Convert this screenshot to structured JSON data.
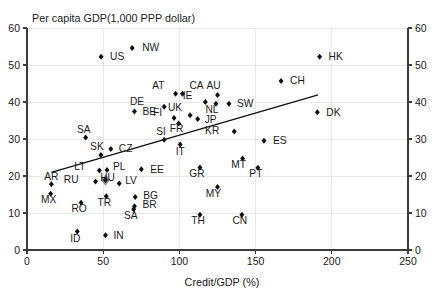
{
  "chart_data": {
    "type": "scatter",
    "title": "Per capita GDP(1,000 PPP dollar)",
    "xlabel": "Credit/GDP (%)",
    "ylabel": "Per capita GDP(1,000 PPP dollar)",
    "xlim": [
      0,
      250
    ],
    "ylim": [
      0,
      60
    ],
    "xticks": [
      0,
      50,
      100,
      150,
      200,
      250
    ],
    "yticks": [
      0,
      10,
      20,
      30,
      40,
      50,
      60
    ],
    "yticks_right": [
      0,
      10,
      20,
      30,
      40,
      50,
      60
    ],
    "grid": true,
    "legend": "none",
    "marker_shape": "diamond",
    "marker_color": "#101010",
    "highlight_color": "#8c8c8c",
    "points": [
      {
        "label": "NW",
        "x": 69.0,
        "y": 54.6,
        "lx": 10,
        "ly": 3.5
      },
      {
        "label": "US",
        "x": 48.6,
        "y": 52.2,
        "lx": 9,
        "ly": 3.5
      },
      {
        "label": "HK",
        "x": 192.0,
        "y": 52.2,
        "lx": 9,
        "ly": 3.5
      },
      {
        "label": "CH",
        "x": 166.7,
        "y": 45.7,
        "lx": 9,
        "ly": 3.5
      },
      {
        "label": "CA",
        "x": 102.0,
        "y": 42.2,
        "lx": 7,
        "ly": -4.5
      },
      {
        "label": "AT",
        "x": 97.5,
        "y": 42.2,
        "lx": -11,
        "ly": -4.5
      },
      {
        "label": "AU",
        "x": 125.0,
        "y": 41.9,
        "lx": -4,
        "ly": -5.5
      },
      {
        "label": "IE",
        "x": 117.0,
        "y": 40.0,
        "lx": -13,
        "ly": -3.5
      },
      {
        "label": "NL",
        "x": 124.0,
        "y": 39.5,
        "lx": -4,
        "ly": 9.5
      },
      {
        "label": "SW",
        "x": 132.5,
        "y": 39.5,
        "lx": 8,
        "ly": 3.5
      },
      {
        "label": "DE",
        "x": 90.0,
        "y": 38.7,
        "lx": -20,
        "ly": -2.0
      },
      {
        "label": "BE",
        "x": 70.5,
        "y": 37.4,
        "lx": 8,
        "ly": 3.5
      },
      {
        "label": "DK",
        "x": 190.5,
        "y": 37.2,
        "lx": 9,
        "ly": 3.5
      },
      {
        "label": "UK",
        "x": 107.0,
        "y": 36.4,
        "lx": -8,
        "ly": -4.5
      },
      {
        "label": "FI",
        "x": 96.5,
        "y": 35.7,
        "lx": -12,
        "ly": -1.5
      },
      {
        "label": "JP",
        "x": 112.0,
        "y": 35.4,
        "lx": 7,
        "ly": 4.0
      },
      {
        "label": "FR",
        "x": 99.5,
        "y": 34.2,
        "lx": -2,
        "ly": 8.5
      },
      {
        "label": "KR",
        "x": 136.0,
        "y": 32.0,
        "lx": -15,
        "ly": 2.0
      },
      {
        "label": "SA",
        "x": 38.5,
        "y": 30.4,
        "lx": -2,
        "ly": -4.5
      },
      {
        "label": "SI",
        "x": 90.0,
        "y": 29.8,
        "lx": -3,
        "ly": -4.5
      },
      {
        "label": "ES",
        "x": 155.5,
        "y": 29.5,
        "lx": 9,
        "ly": 3.5
      },
      {
        "label": "IT",
        "x": 100.5,
        "y": 28.5,
        "lx": 0,
        "ly": 10.0
      },
      {
        "label": "CZ",
        "x": 55.0,
        "y": 27.3,
        "lx": 8,
        "ly": 3.5
      },
      {
        "label": "SK",
        "x": 48.5,
        "y": 25.7,
        "lx": -4,
        "ly": -4.5
      },
      {
        "label": "MT",
        "x": 141.5,
        "y": 24.7,
        "lx": -4,
        "ly": 9.5
      },
      {
        "label": "GR",
        "x": 113.5,
        "y": 22.3,
        "lx": -3,
        "ly": 9.5
      },
      {
        "label": "PT",
        "x": 151.5,
        "y": 22.2,
        "lx": -2,
        "ly": 9.5
      },
      {
        "label": "EE",
        "x": 75.0,
        "y": 21.8,
        "lx": 9,
        "ly": 3.5
      },
      {
        "label": "PL",
        "x": 52.5,
        "y": 21.6,
        "lx": 6,
        "ly": 0.0
      },
      {
        "label": "LT",
        "x": 47.5,
        "y": 21.5,
        "lx": -14,
        "ly": 0.0
      },
      {
        "label": "AR",
        "x": 16.0,
        "y": 17.8,
        "lx": 0,
        "ly": -4.5
      },
      {
        "label": "LV",
        "x": 60.5,
        "y": 18.0,
        "lx": 6,
        "ly": 1.0
      },
      {
        "label": "HU",
        "x": 51.5,
        "y": 18.9,
        "lx": 2,
        "ly": 1.0,
        "highlight": true
      },
      {
        "label": "RU",
        "x": 45.0,
        "y": 18.5,
        "lx": -17,
        "ly": 1.0
      },
      {
        "label": "MY",
        "x": 125.0,
        "y": 17.0,
        "lx": -4,
        "ly": 9.5
      },
      {
        "label": "MX",
        "x": 15.5,
        "y": 15.2,
        "lx": -2,
        "ly": 9.5
      },
      {
        "label": "TR",
        "x": 52.0,
        "y": 14.5,
        "lx": -2,
        "ly": 9.5
      },
      {
        "label": "BG",
        "x": 71.0,
        "y": 14.3,
        "lx": 8,
        "ly": 1.5
      },
      {
        "label": "BR",
        "x": 70.5,
        "y": 11.8,
        "lx": 8,
        "ly": 2.0
      },
      {
        "label": "SA2",
        "x": 70.0,
        "y": 11.0,
        "lx": -3,
        "ly": 10.0,
        "labeltext": "SA"
      },
      {
        "label": "RO",
        "x": 35.5,
        "y": 12.8,
        "lx": -2,
        "ly": 9.5
      },
      {
        "label": "CN",
        "x": 141.0,
        "y": 9.5,
        "lx": -2,
        "ly": 9.5
      },
      {
        "label": "TH",
        "x": 113.5,
        "y": 9.5,
        "lx": -2,
        "ly": 9.5
      },
      {
        "label": "ID",
        "x": 33.0,
        "y": 5.0,
        "lx": -2,
        "ly": 10.0
      },
      {
        "label": "IN",
        "x": 51.5,
        "y": 4.0,
        "lx": 8,
        "ly": 3.5
      }
    ],
    "trendline": {
      "x0": 16.0,
      "y0": 21.0,
      "x1": 191.0,
      "y1": 41.9
    }
  }
}
